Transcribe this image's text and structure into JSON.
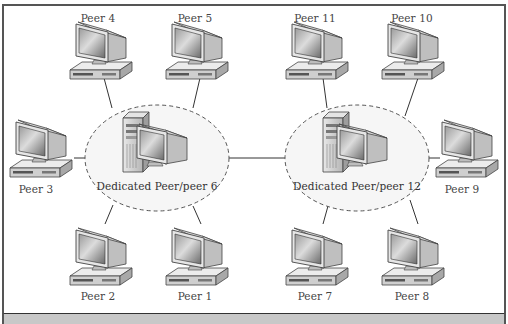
{
  "diagram": {
    "type": "hybrid peer-to-peer network",
    "hubs": [
      {
        "id": "hub-6",
        "label": "Dedicated Peer/peer 6",
        "cx": 157,
        "cy": 158
      },
      {
        "id": "hub-12",
        "label": "Dedicated Peer/peer 12",
        "cx": 357,
        "cy": 158
      }
    ],
    "peers": [
      {
        "id": "peer-4",
        "label": "Peer 4",
        "x": 98,
        "labelY": 12,
        "hub": "hub-6"
      },
      {
        "id": "peer-5",
        "label": "Peer 5",
        "x": 195,
        "labelY": 12,
        "hub": "hub-6"
      },
      {
        "id": "peer-3",
        "label": "Peer 3",
        "x": 36,
        "labelY": 183,
        "hub": "hub-6"
      },
      {
        "id": "peer-2",
        "label": "Peer 2",
        "x": 98,
        "labelY": 290,
        "hub": "hub-6"
      },
      {
        "id": "peer-1",
        "label": "Peer 1",
        "x": 195,
        "labelY": 290,
        "hub": "hub-6"
      },
      {
        "id": "peer-11",
        "label": "Peer 11",
        "x": 315,
        "labelY": 12,
        "hub": "hub-12"
      },
      {
        "id": "peer-10",
        "label": "Peer 10",
        "x": 412,
        "labelY": 12,
        "hub": "hub-12"
      },
      {
        "id": "peer-9",
        "label": "Peer 9",
        "x": 462,
        "labelY": 183,
        "hub": "hub-12"
      },
      {
        "id": "peer-7",
        "label": "Peer 7",
        "x": 315,
        "labelY": 290,
        "hub": "hub-12"
      },
      {
        "id": "peer-8",
        "label": "Peer 8",
        "x": 412,
        "labelY": 290,
        "hub": "hub-12"
      }
    ],
    "links": [
      [
        "hub-6",
        "hub-12"
      ]
    ]
  },
  "colors": {
    "frame_border": "#555555",
    "caption_bar": "#c8c8c8",
    "dashed_ellipse": "#555555",
    "ellipse_fill": "#f6f6f6",
    "line": "#333333",
    "text": "#444444"
  }
}
